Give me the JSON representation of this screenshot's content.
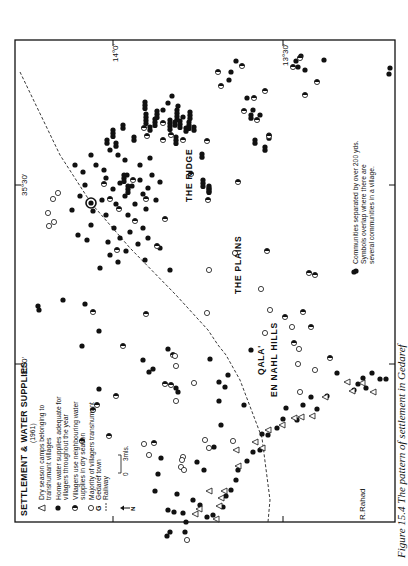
{
  "map": {
    "legend": {
      "title": "SETTLEMENT & WATER SUPPLIES",
      "year": "(1961)",
      "items": [
        {
          "symbol": "triangle-open",
          "label_lines": [
            "Dry season camps belonging to",
            "transhumant villages"
          ]
        },
        {
          "symbol": "circle-filled",
          "label_lines": [
            "Home water supplies adequate for",
            "villagers throughout the year"
          ]
        },
        {
          "symbol": "circle-half",
          "label_lines": [
            "Villagers use neighbouring water",
            "supplies in dry season"
          ]
        },
        {
          "symbol": "circle-open",
          "label_lines": [
            "Majority of villagers transhumant"
          ]
        },
        {
          "symbol": "G",
          "label_lines": [
            "Gedaref town"
          ]
        },
        {
          "symbol": "dash-line",
          "label_lines": [
            "Railway"
          ]
        }
      ],
      "scale": {
        "zero": "0",
        "end": "3mls."
      },
      "north": "N"
    },
    "note_lines": [
      "Communities separated by over 200 yds.",
      "Symbols overlap where there are",
      "several communities in a village."
    ],
    "place_labels": {
      "ridge": "THE RIDGE",
      "plains": "THE PLAINS",
      "hills_1": "QALA'",
      "hills_2": "EN NAHL HILLS",
      "river": "R.Rahad"
    },
    "graticule": {
      "lon_35_0": "35°0'",
      "lon_35_30": "35°30'",
      "lat_14_0": "14°0'",
      "lat_13_30": "13°30'"
    },
    "caption": "Figure 15.4  The pattern of settlement in Gedaref",
    "colors": {
      "ink": "#111111",
      "paper": "#ffffff"
    },
    "points": {
      "filled": [
        [
          93,
          211
        ],
        [
          102,
          200
        ],
        [
          106,
          215
        ],
        [
          113,
          189
        ],
        [
          116,
          204
        ],
        [
          120,
          183
        ],
        [
          125,
          196
        ],
        [
          127,
          175
        ],
        [
          128,
          215
        ],
        [
          132,
          186
        ],
        [
          135,
          204
        ],
        [
          140,
          180
        ],
        [
          143,
          194
        ],
        [
          146,
          209
        ],
        [
          148,
          188
        ],
        [
          152,
          175
        ],
        [
          114,
          228
        ],
        [
          108,
          242
        ],
        [
          120,
          238
        ],
        [
          126,
          251
        ],
        [
          130,
          232
        ],
        [
          138,
          244
        ],
        [
          143,
          228
        ],
        [
          148,
          238
        ],
        [
          156,
          200
        ],
        [
          160,
          182
        ],
        [
          106,
          178
        ],
        [
          110,
          255
        ],
        [
          118,
          262
        ],
        [
          145,
          260
        ],
        [
          160,
          248
        ],
        [
          170,
          270
        ],
        [
          100,
          268
        ],
        [
          91,
          225
        ],
        [
          87,
          240
        ],
        [
          85,
          185
        ],
        [
          80,
          196
        ],
        [
          72,
          210
        ],
        [
          78,
          235
        ],
        [
          75,
          165
        ],
        [
          83,
          172
        ],
        [
          96,
          165
        ],
        [
          104,
          170
        ],
        [
          140,
          165
        ],
        [
          150,
          158
        ],
        [
          118,
          155
        ],
        [
          125,
          160
        ],
        [
          110,
          150
        ],
        [
          91,
          155
        ],
        [
          163,
          110
        ],
        [
          168,
          103
        ],
        [
          172,
          96
        ],
        [
          178,
          106
        ],
        [
          183,
          117
        ],
        [
          229,
          80
        ],
        [
          231,
          72
        ],
        [
          236,
          61
        ],
        [
          247,
          98
        ],
        [
          253,
          110
        ],
        [
          260,
          115
        ],
        [
          296,
          61
        ],
        [
          301,
          56
        ],
        [
          298,
          67
        ],
        [
          305,
          70
        ],
        [
          324,
          60
        ],
        [
          390,
          68
        ],
        [
          389,
          74
        ],
        [
          39,
          310
        ],
        [
          38,
          306
        ],
        [
          63,
          300
        ],
        [
          85,
          304
        ],
        [
          99,
          331
        ],
        [
          82,
          346
        ],
        [
          99,
          389
        ],
        [
          149,
          372
        ],
        [
          153,
          369
        ],
        [
          168,
          349
        ],
        [
          143,
          360
        ],
        [
          176,
          388
        ],
        [
          178,
          392
        ],
        [
          210,
          359
        ],
        [
          219,
          382
        ],
        [
          225,
          387
        ],
        [
          228,
          375
        ],
        [
          251,
          350
        ],
        [
          219,
          401
        ],
        [
          244,
          405
        ],
        [
          262,
          434
        ],
        [
          221,
          425
        ],
        [
          214,
          447
        ],
        [
          286,
          408
        ],
        [
          197,
          462
        ],
        [
          204,
          470
        ],
        [
          177,
          494
        ],
        [
          155,
          491
        ],
        [
          158,
          474
        ],
        [
          161,
          458
        ],
        [
          168,
          510
        ],
        [
          174,
          512
        ],
        [
          183,
          513
        ],
        [
          186,
          522
        ],
        [
          185,
          532
        ],
        [
          167,
          536
        ],
        [
          170,
          532
        ],
        [
          193,
          500
        ],
        [
          200,
          505
        ],
        [
          207,
          517
        ],
        [
          213,
          515
        ],
        [
          223,
          507
        ],
        [
          226,
          496
        ],
        [
          231,
          490
        ],
        [
          236,
          480
        ],
        [
          238,
          470
        ],
        [
          247,
          461
        ],
        [
          253,
          452
        ],
        [
          260,
          450
        ],
        [
          268,
          435
        ],
        [
          277,
          428
        ],
        [
          283,
          419
        ],
        [
          297,
          420
        ],
        [
          303,
          405
        ],
        [
          311,
          397
        ],
        [
          317,
          409
        ],
        [
          327,
          396
        ],
        [
          354,
          390
        ],
        [
          358,
          384
        ],
        [
          363,
          378
        ],
        [
          366,
          388
        ],
        [
          372,
          373
        ],
        [
          380,
          379
        ],
        [
          386,
          379
        ],
        [
          356,
          271
        ],
        [
          337,
          373
        ]
      ],
      "half": [
        [
          119,
          209
        ],
        [
          117,
          250
        ],
        [
          104,
          184
        ],
        [
          135,
          221
        ],
        [
          110,
          199
        ],
        [
          146,
          199
        ],
        [
          133,
          180
        ],
        [
          165,
          219
        ],
        [
          163,
          123
        ],
        [
          144,
          128
        ],
        [
          147,
          136
        ],
        [
          163,
          140
        ],
        [
          171,
          135
        ],
        [
          183,
          140
        ],
        [
          191,
          174
        ],
        [
          207,
          141
        ],
        [
          218,
          72
        ],
        [
          221,
          86
        ],
        [
          242,
          66
        ],
        [
          254,
          98
        ],
        [
          257,
          120
        ],
        [
          293,
          67
        ],
        [
          300,
          58
        ],
        [
          317,
          82
        ],
        [
          305,
          95
        ],
        [
          265,
          91
        ],
        [
          244,
          111
        ],
        [
          269,
          136
        ],
        [
          238,
          182
        ],
        [
          208,
          200
        ],
        [
          157,
          246
        ],
        [
          146,
          314
        ],
        [
          93,
          312
        ],
        [
          97,
          405
        ],
        [
          93,
          410
        ],
        [
          116,
          396
        ],
        [
          165,
          384
        ],
        [
          171,
          385
        ],
        [
          173,
          355
        ],
        [
          123,
          346
        ],
        [
          154,
          443
        ],
        [
          109,
          436
        ],
        [
          82,
          441
        ],
        [
          285,
          317
        ],
        [
          303,
          312
        ],
        [
          267,
          251
        ],
        [
          330,
          358
        ],
        [
          294,
          343
        ],
        [
          311,
          327
        ],
        [
          309,
          273
        ],
        [
          315,
          275
        ]
      ],
      "open": [
        [
          49,
          226
        ],
        [
          54,
          222
        ],
        [
          48,
          213
        ],
        [
          53,
          199
        ],
        [
          58,
          193
        ],
        [
          176,
          366
        ],
        [
          175,
          356
        ],
        [
          194,
          383
        ],
        [
          176,
          401
        ],
        [
          233,
          441
        ],
        [
          299,
          349
        ],
        [
          298,
          364
        ],
        [
          300,
          392
        ],
        [
          235,
          253
        ],
        [
          261,
          289
        ],
        [
          315,
          370
        ],
        [
          270,
          310
        ],
        [
          265,
          333
        ],
        [
          292,
          327
        ],
        [
          187,
          540
        ],
        [
          183,
          457
        ],
        [
          182,
          460
        ],
        [
          181,
          467
        ],
        [
          184,
          470
        ],
        [
          144,
          444
        ],
        [
          149,
          455
        ],
        [
          205,
          440
        ],
        [
          209,
          448
        ],
        [
          209,
          270
        ],
        [
          207,
          313
        ]
      ],
      "triangles": [
        [
          209,
          491
        ],
        [
          199,
          509
        ],
        [
          195,
          514
        ],
        [
          216,
          519
        ],
        [
          219,
          506
        ],
        [
          221,
          498
        ],
        [
          224,
          491
        ],
        [
          236,
          450
        ],
        [
          238,
          466
        ],
        [
          255,
          442
        ],
        [
          262,
          448
        ],
        [
          268,
          430
        ],
        [
          282,
          425
        ],
        [
          294,
          418
        ],
        [
          301,
          417
        ],
        [
          312,
          416
        ],
        [
          325,
          397
        ],
        [
          347,
          382
        ],
        [
          352,
          391
        ],
        [
          362,
          383
        ],
        [
          373,
          392
        ]
      ],
      "columns": [
        [
          145,
          102,
          3
        ],
        [
          146,
          114,
          4
        ],
        [
          155,
          119,
          3
        ],
        [
          157,
          111,
          3
        ],
        [
          170,
          120,
          4
        ],
        [
          177,
          110,
          4
        ],
        [
          176,
          137,
          3
        ],
        [
          124,
          175,
          3
        ],
        [
          128,
          186,
          3
        ],
        [
          202,
          154,
          2
        ],
        [
          203,
          180,
          3
        ],
        [
          251,
          115,
          2
        ],
        [
          269,
          135,
          2
        ],
        [
          134,
          137,
          2
        ],
        [
          116,
          143,
          2
        ],
        [
          113,
          130,
          3
        ],
        [
          123,
          125,
          2
        ],
        [
          255,
          140,
          2
        ],
        [
          265,
          147,
          2
        ],
        [
          107,
          140,
          2
        ],
        [
          209,
          186,
          3
        ],
        [
          209,
          188,
          2
        ],
        [
          180,
          121,
          3
        ],
        [
          189,
          122,
          3
        ],
        [
          190,
          112,
          3
        ],
        [
          175,
          122,
          2
        ],
        [
          186,
          128,
          2
        ],
        [
          194,
          127,
          2
        ],
        [
          150,
          127,
          2
        ]
      ]
    },
    "gedaref_town": [
      91,
      203
    ],
    "railway": [
      [
        20,
        72
      ],
      [
        60,
        155
      ],
      [
        91,
        203
      ],
      [
        130,
        248
      ],
      [
        176,
        295
      ],
      [
        208,
        330
      ],
      [
        218,
        345
      ],
      [
        226,
        355
      ],
      [
        240,
        380
      ],
      [
        262,
        438
      ],
      [
        270,
        500
      ],
      [
        268,
        522
      ]
    ]
  }
}
